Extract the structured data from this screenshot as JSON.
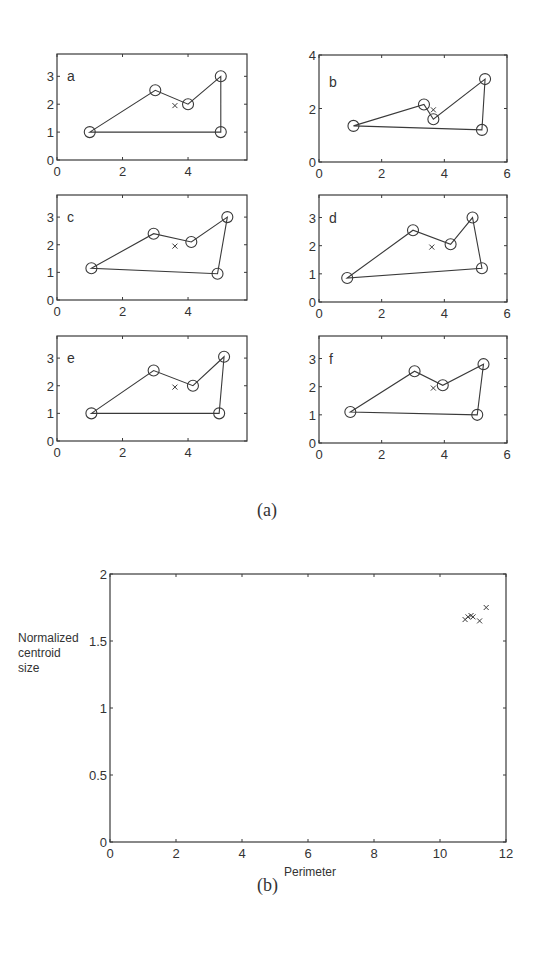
{
  "captions": {
    "a": "(a)",
    "b": "(b)"
  },
  "chart_data": [
    {
      "type": "line",
      "panel": "a",
      "label": "a",
      "xlim": [
        0,
        5.8
      ],
      "ylim": [
        0,
        3.8
      ],
      "xticks": [
        0,
        2,
        4
      ],
      "yticks": [
        0,
        1,
        2,
        3
      ],
      "polygon": [
        [
          1,
          1
        ],
        [
          3,
          2.5
        ],
        [
          4,
          2
        ],
        [
          5,
          3
        ],
        [
          5,
          1
        ]
      ],
      "centroid": [
        3.6,
        1.95
      ]
    },
    {
      "type": "line",
      "panel": "b",
      "label": "b",
      "xlim": [
        0,
        6
      ],
      "ylim": [
        0,
        4
      ],
      "xticks": [
        0,
        2,
        4,
        6
      ],
      "yticks": [
        0,
        2,
        4
      ],
      "polygon": [
        [
          1.1,
          1.35
        ],
        [
          3.35,
          2.15
        ],
        [
          3.65,
          1.6
        ],
        [
          5.3,
          3.1
        ],
        [
          5.2,
          1.2
        ]
      ],
      "centroid": [
        3.65,
        1.95
      ]
    },
    {
      "type": "line",
      "panel": "c",
      "label": "c",
      "xlim": [
        0,
        5.8
      ],
      "ylim": [
        0,
        3.8
      ],
      "xticks": [
        0,
        2,
        4
      ],
      "yticks": [
        0,
        1,
        2,
        3
      ],
      "polygon": [
        [
          1.05,
          1.15
        ],
        [
          2.95,
          2.4
        ],
        [
          4.1,
          2.1
        ],
        [
          5.2,
          3
        ],
        [
          4.9,
          0.95
        ]
      ],
      "centroid": [
        3.6,
        1.95
      ]
    },
    {
      "type": "line",
      "panel": "d",
      "label": "d",
      "xlim": [
        0,
        6
      ],
      "ylim": [
        0,
        3.8
      ],
      "xticks": [
        0,
        2,
        4,
        6
      ],
      "yticks": [
        0,
        1,
        2,
        3
      ],
      "polygon": [
        [
          0.9,
          0.85
        ],
        [
          3,
          2.55
        ],
        [
          4.2,
          2.05
        ],
        [
          4.9,
          3
        ],
        [
          5.2,
          1.2
        ]
      ],
      "centroid": [
        3.6,
        1.95
      ]
    },
    {
      "type": "line",
      "panel": "e",
      "label": "e",
      "xlim": [
        0,
        5.8
      ],
      "ylim": [
        0,
        3.8
      ],
      "xticks": [
        0,
        2,
        4
      ],
      "yticks": [
        0,
        1,
        2,
        3
      ],
      "polygon": [
        [
          1.05,
          1
        ],
        [
          2.95,
          2.55
        ],
        [
          4.15,
          2
        ],
        [
          5.1,
          3.05
        ],
        [
          4.95,
          1
        ]
      ],
      "centroid": [
        3.6,
        1.95
      ]
    },
    {
      "type": "line",
      "panel": "f",
      "label": "f",
      "xlim": [
        0,
        6
      ],
      "ylim": [
        0,
        3.8
      ],
      "xticks": [
        0,
        2,
        4,
        6
      ],
      "yticks": [
        0,
        1,
        2,
        3
      ],
      "polygon": [
        [
          1,
          1.1
        ],
        [
          3.05,
          2.55
        ],
        [
          3.95,
          2.05
        ],
        [
          5.25,
          2.8
        ],
        [
          5.05,
          1
        ]
      ],
      "centroid": [
        3.65,
        1.95
      ]
    },
    {
      "type": "scatter",
      "panel": "b-bottom",
      "title": "",
      "xlabel": "Perimeter",
      "ylabel": "Normalized centroid size",
      "xlim": [
        0,
        12
      ],
      "ylim": [
        0,
        2
      ],
      "xticks": [
        0,
        2,
        4,
        6,
        8,
        10,
        12
      ],
      "yticks": [
        0,
        0.5,
        1,
        1.5,
        2
      ],
      "ytick_labels": [
        "0",
        "0.5",
        "1",
        "1.5",
        "2"
      ],
      "marker": "x",
      "points": [
        [
          10.76,
          1.66
        ],
        [
          10.85,
          1.68
        ],
        [
          10.94,
          1.69
        ],
        [
          11.0,
          1.68
        ],
        [
          11.2,
          1.65
        ],
        [
          11.4,
          1.75
        ]
      ]
    }
  ],
  "bottom": {
    "xlabel": "Perimeter",
    "ylabel_lines": [
      "Normalized",
      "centroid",
      "size"
    ]
  }
}
